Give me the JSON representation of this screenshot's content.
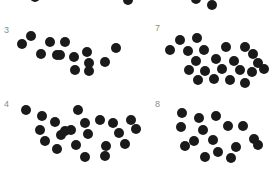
{
  "canvas": {
    "width": 280,
    "height": 170,
    "background": "#ffffff"
  },
  "style": {
    "dot_color": "#1a1a1a",
    "label_color": "#8c8c8c",
    "dot_diameter": 10.5,
    "label_font_size": 9
  },
  "stimulus": {
    "type": "numerosity-dot-array-grid",
    "columns": 2,
    "rows": 2,
    "visible_labels": [
      "3",
      "7",
      "4",
      "8"
    ],
    "partial_top_row": true
  },
  "groups": [
    {
      "id": "group-3",
      "label": "3",
      "label_x": 4,
      "label_y": 26,
      "dot_count": 14,
      "dots": [
        [
          31,
          36
        ],
        [
          22,
          44
        ],
        [
          50,
          42
        ],
        [
          65,
          42
        ],
        [
          41,
          54
        ],
        [
          57,
          55
        ],
        [
          74,
          57
        ],
        [
          87,
          52
        ],
        [
          116,
          48
        ],
        [
          89,
          63
        ],
        [
          105,
          62
        ],
        [
          75,
          70
        ],
        [
          89,
          71
        ],
        [
          60,
          55
        ]
      ]
    },
    {
      "id": "group-7",
      "label": "7",
      "label_x": 155,
      "label_y": 24,
      "dot_count": 22,
      "dots": [
        [
          180,
          40
        ],
        [
          197,
          38
        ],
        [
          170,
          50
        ],
        [
          188,
          51
        ],
        [
          204,
          50
        ],
        [
          226,
          47
        ],
        [
          245,
          47
        ],
        [
          196,
          61
        ],
        [
          216,
          59
        ],
        [
          234,
          61
        ],
        [
          253,
          54
        ],
        [
          258,
          63
        ],
        [
          189,
          70
        ],
        [
          205,
          71
        ],
        [
          222,
          69
        ],
        [
          240,
          70
        ],
        [
          252,
          72
        ],
        [
          264,
          69
        ],
        [
          198,
          80
        ],
        [
          230,
          80
        ],
        [
          245,
          83
        ],
        [
          214,
          79
        ]
      ]
    },
    {
      "id": "group-4",
      "label": "4",
      "label_x": 4,
      "label_y": 100,
      "dot_count": 22,
      "dots": [
        [
          26,
          110
        ],
        [
          42,
          116
        ],
        [
          78,
          110
        ],
        [
          55,
          122
        ],
        [
          40,
          130
        ],
        [
          85,
          123
        ],
        [
          71,
          130
        ],
        [
          100,
          120
        ],
        [
          113,
          123
        ],
        [
          131,
          120
        ],
        [
          45,
          141
        ],
        [
          61,
          135
        ],
        [
          88,
          134
        ],
        [
          119,
          133
        ],
        [
          136,
          129
        ],
        [
          57,
          149
        ],
        [
          76,
          145
        ],
        [
          106,
          146
        ],
        [
          125,
          144
        ],
        [
          85,
          157
        ],
        [
          105,
          156
        ],
        [
          65,
          131
        ]
      ]
    },
    {
      "id": "group-8",
      "label": "8",
      "label_x": 155,
      "label_y": 100,
      "dot_count": 16,
      "dots": [
        [
          182,
          113
        ],
        [
          199,
          118
        ],
        [
          216,
          116
        ],
        [
          181,
          127
        ],
        [
          203,
          130
        ],
        [
          228,
          126
        ],
        [
          243,
          126
        ],
        [
          194,
          141
        ],
        [
          213,
          140
        ],
        [
          254,
          139
        ],
        [
          185,
          146
        ],
        [
          218,
          152
        ],
        [
          236,
          147
        ],
        [
          258,
          145
        ],
        [
          205,
          157
        ],
        [
          231,
          158
        ]
      ]
    },
    {
      "id": "group-top-partial",
      "label": "",
      "dot_count": 4,
      "dots": [
        [
          35,
          -3
        ],
        [
          128,
          0
        ],
        [
          196,
          -1
        ],
        [
          212,
          5
        ]
      ]
    }
  ]
}
